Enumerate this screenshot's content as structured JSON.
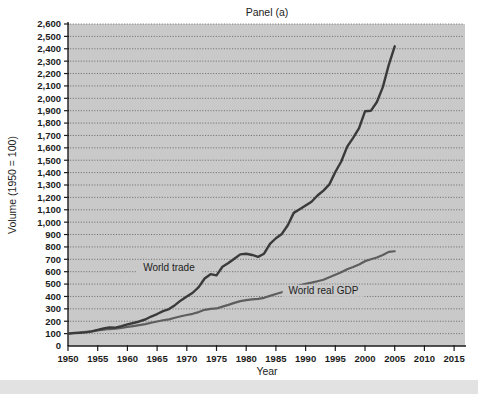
{
  "figure": {
    "panel_title": "Panel (a)",
    "background_color": "#ffffff",
    "plot_background_color": "#c9c9c9"
  },
  "chart_data": {
    "type": "line",
    "title": "Panel (a)",
    "xlabel": "Year",
    "ylabel": "Volume (1950 = 100)",
    "xlim": [
      1950,
      2017
    ],
    "ylim": [
      0,
      2600
    ],
    "grid": true,
    "grid_axis": "y",
    "legend_position": "inline-annotations",
    "xticks": [
      1950,
      1955,
      1960,
      1965,
      1970,
      1975,
      1980,
      1985,
      1990,
      1995,
      2000,
      2005,
      2010,
      2015
    ],
    "xtick_labels": [
      "1950",
      "1955",
      "1960",
      "1965",
      "1970",
      "1975",
      "1980",
      "1985",
      "1990",
      "1995",
      "2000",
      "2005",
      "2010",
      "2015"
    ],
    "yticks": [
      0,
      100,
      200,
      300,
      400,
      500,
      600,
      700,
      800,
      900,
      1000,
      1100,
      1200,
      1300,
      1400,
      1500,
      1600,
      1700,
      1800,
      1900,
      2000,
      2100,
      2200,
      2300,
      2400,
      2500,
      2600
    ],
    "ytick_labels": [
      "0",
      "100",
      "200",
      "300",
      "400",
      "500",
      "600",
      "700",
      "800",
      "900",
      "1,000",
      "1,100",
      "1,200",
      "1,300",
      "1,400",
      "1,500",
      "1,600",
      "1,700",
      "1,800",
      "1,900",
      "2,000",
      "2,100",
      "2,200",
      "2,300",
      "2,400",
      "2,500",
      "2,600"
    ],
    "series": [
      {
        "name": "World trade",
        "color": "#3a3a3a",
        "annotation": "World trade",
        "x": [
          1950,
          1951,
          1952,
          1953,
          1954,
          1955,
          1956,
          1957,
          1958,
          1959,
          1960,
          1961,
          1962,
          1963,
          1964,
          1965,
          1966,
          1967,
          1968,
          1969,
          1970,
          1971,
          1972,
          1973,
          1974,
          1975,
          1976,
          1977,
          1978,
          1979,
          1980,
          1981,
          1982,
          1983,
          1984,
          1985,
          1986,
          1987,
          1988,
          1989,
          1990,
          1991,
          1992,
          1993,
          1994,
          1995,
          1996,
          1997,
          1998,
          1999,
          2000,
          2001,
          2002,
          2003,
          2004,
          2005
        ],
        "y": [
          100,
          104,
          106,
          110,
          118,
          130,
          142,
          150,
          148,
          160,
          175,
          186,
          198,
          214,
          238,
          258,
          282,
          298,
          330,
          368,
          400,
          430,
          475,
          545,
          580,
          570,
          640,
          670,
          705,
          740,
          745,
          735,
          720,
          745,
          825,
          870,
          905,
          975,
          1075,
          1105,
          1135,
          1165,
          1215,
          1255,
          1305,
          1405,
          1490,
          1610,
          1680,
          1760,
          1895,
          1900,
          1970,
          2090,
          2270,
          2420
        ]
      },
      {
        "name": "World real GDP",
        "color": "#5e5e5e",
        "annotation": "World real GDP",
        "x": [
          1950,
          1951,
          1952,
          1953,
          1954,
          1955,
          1956,
          1957,
          1958,
          1959,
          1960,
          1961,
          1962,
          1963,
          1964,
          1965,
          1966,
          1967,
          1968,
          1969,
          1970,
          1971,
          1972,
          1973,
          1974,
          1975,
          1976,
          1977,
          1978,
          1979,
          1980,
          1981,
          1982,
          1983,
          1984,
          1985,
          1986,
          1987,
          1988,
          1989,
          1990,
          1991,
          1992,
          1993,
          1994,
          1995,
          1996,
          1997,
          1998,
          1999,
          2000,
          2001,
          2002,
          2003,
          2004,
          2005
        ],
        "y": [
          100,
          106,
          110,
          115,
          118,
          126,
          132,
          137,
          140,
          147,
          154,
          161,
          169,
          177,
          188,
          198,
          208,
          215,
          228,
          240,
          250,
          260,
          274,
          292,
          300,
          303,
          318,
          332,
          348,
          362,
          370,
          376,
          380,
          389,
          405,
          420,
          434,
          452,
          473,
          490,
          503,
          512,
          523,
          535,
          555,
          575,
          596,
          620,
          638,
          658,
          685,
          700,
          715,
          735,
          760,
          765
        ]
      }
    ],
    "annotations": [
      {
        "text": "World trade",
        "x": 1967,
        "y": 620
      },
      {
        "text": "World real GDP",
        "x": 1993,
        "y": 430
      }
    ]
  }
}
